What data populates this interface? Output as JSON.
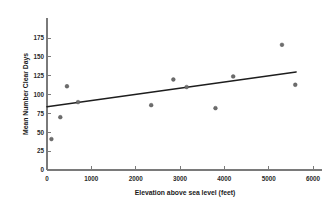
{
  "chart_data": {
    "type": "scatter",
    "title": "",
    "xlabel": "Elevation above sea level (feet)",
    "ylabel": "Mean Number Clear Days",
    "xlim": [
      0,
      6000
    ],
    "ylim": [
      0,
      187
    ],
    "grid": false,
    "legend": null,
    "xticks": [
      0,
      1000,
      2000,
      3000,
      4000,
      5000,
      6000
    ],
    "xtick_labels": [
      "0",
      "1000",
      "2000",
      "3000",
      "4000",
      "5000",
      "6000"
    ],
    "yticks": [
      0,
      25,
      50,
      75,
      100,
      125,
      150,
      175
    ],
    "ytick_labels": [
      "0",
      "25",
      "50",
      "75",
      "100",
      "125",
      "150",
      "175"
    ],
    "marker_color": "#6d6d6d",
    "line_color": "#1d1d1d",
    "axis_color": "#7a7a7a",
    "points": [
      {
        "x": 100,
        "y": 41
      },
      {
        "x": 300,
        "y": 70
      },
      {
        "x": 450,
        "y": 111
      },
      {
        "x": 700,
        "y": 90
      },
      {
        "x": 2350,
        "y": 86
      },
      {
        "x": 2850,
        "y": 120
      },
      {
        "x": 3150,
        "y": 110
      },
      {
        "x": 3800,
        "y": 82
      },
      {
        "x": 4200,
        "y": 124
      },
      {
        "x": 5300,
        "y": 166
      },
      {
        "x": 5600,
        "y": 113
      }
    ],
    "trend_line": {
      "name": "least-squares regression line",
      "x_start": 0,
      "y_start": 84,
      "x_end": 5620,
      "y_end": 130
    }
  }
}
